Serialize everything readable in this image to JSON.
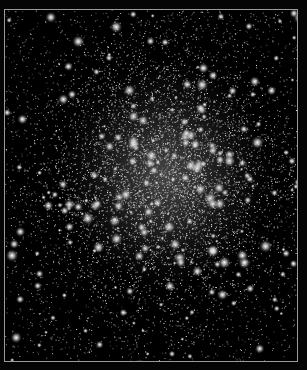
{
  "image": {
    "subject": "globular star cluster",
    "background_color": "#000000",
    "frame_color": "#9a9a9a",
    "star_color": "#ffffff",
    "cluster_center": [
      160,
      165
    ]
  }
}
